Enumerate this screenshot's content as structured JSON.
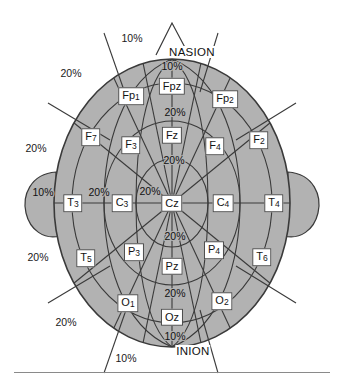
{
  "figure": {
    "scalp_color": "#b2b2b2",
    "outline_color": "#3a3a3a",
    "label_box_color": "#ffffff"
  },
  "anatomy": {
    "nasion": "NASION",
    "inion": "INION"
  },
  "electrodes": [
    {
      "id": "Fpz",
      "label": "Fpz",
      "main": "Fpz",
      "sub": "",
      "x": 172,
      "y": 86
    },
    {
      "id": "Fp1",
      "label": "Fp1",
      "main": "Fp",
      "sub": "1",
      "x": 131,
      "y": 96
    },
    {
      "id": "Fp2",
      "label": "Fp2",
      "main": "Fp",
      "sub": "2",
      "x": 225,
      "y": 99
    },
    {
      "id": "Fz",
      "label": "Fz",
      "main": "Fz",
      "sub": "",
      "x": 172,
      "y": 135
    },
    {
      "id": "F7",
      "label": "F7",
      "main": "F",
      "sub": "7",
      "x": 91,
      "y": 137
    },
    {
      "id": "F3",
      "label": "F3",
      "main": "F",
      "sub": "3",
      "x": 131,
      "y": 145
    },
    {
      "id": "F4",
      "label": "F4",
      "main": "F",
      "sub": "4",
      "x": 215,
      "y": 146
    },
    {
      "id": "F2",
      "label": "F2",
      "main": "F",
      "sub": "2",
      "x": 259,
      "y": 140
    },
    {
      "id": "T3",
      "label": "T3",
      "main": "T",
      "sub": "3",
      "x": 73,
      "y": 203
    },
    {
      "id": "C3",
      "label": "C3",
      "main": "C",
      "sub": "3",
      "x": 122,
      "y": 203
    },
    {
      "id": "Cz",
      "label": "Cz",
      "main": "Cz",
      "sub": "",
      "x": 172,
      "y": 203
    },
    {
      "id": "C4",
      "label": "C4",
      "main": "C",
      "sub": "4",
      "x": 223,
      "y": 203
    },
    {
      "id": "T4",
      "label": "T4",
      "main": "T",
      "sub": "4",
      "x": 274,
      "y": 203
    },
    {
      "id": "P3",
      "label": "P3",
      "main": "P",
      "sub": "3",
      "x": 134,
      "y": 252
    },
    {
      "id": "Pz",
      "label": "Pz",
      "main": "Pz",
      "sub": "",
      "x": 172,
      "y": 266
    },
    {
      "id": "P4",
      "label": "P4",
      "main": "P",
      "sub": "4",
      "x": 214,
      "y": 250
    },
    {
      "id": "T5",
      "label": "T5",
      "main": "T",
      "sub": "5",
      "x": 86,
      "y": 258
    },
    {
      "id": "T6",
      "label": "T6",
      "main": "T",
      "sub": "6",
      "x": 262,
      "y": 257
    },
    {
      "id": "O1",
      "label": "O1",
      "main": "O",
      "sub": "1",
      "x": 128,
      "y": 303
    },
    {
      "id": "Oz",
      "label": "Oz",
      "main": "Oz",
      "sub": "",
      "x": 172,
      "y": 317
    },
    {
      "id": "O2",
      "label": "O2",
      "main": "O",
      "sub": "2",
      "x": 222,
      "y": 301
    }
  ],
  "percent_labels": [
    {
      "id": "pct-sagittal-nasion-fpz",
      "text": "10%",
      "x": 172,
      "y": 66,
      "where": "onhead"
    },
    {
      "id": "pct-sagittal-fpz-fz",
      "text": "20%",
      "x": 175,
      "y": 112,
      "where": "onhead"
    },
    {
      "id": "pct-sagittal-fz-cz",
      "text": "20%",
      "x": 174,
      "y": 160,
      "where": "onhead"
    },
    {
      "id": "pct-sagittal-cz-pz",
      "text": "20%",
      "x": 175,
      "y": 236,
      "where": "onhead"
    },
    {
      "id": "pct-sagittal-pz-oz",
      "text": "20%",
      "x": 175,
      "y": 293,
      "where": "onhead"
    },
    {
      "id": "pct-sagittal-oz-inion",
      "text": "10%",
      "x": 175,
      "y": 336,
      "where": "onhead"
    },
    {
      "id": "pct-coronal-ear-t3",
      "text": "10%",
      "x": 43,
      "y": 192,
      "where": "onhead"
    },
    {
      "id": "pct-coronal-t3-c3",
      "text": "20%",
      "x": 99,
      "y": 192,
      "where": "onhead"
    },
    {
      "id": "pct-coronal-c3-cz",
      "text": "20%",
      "x": 150,
      "y": 191,
      "where": "onhead"
    },
    {
      "id": "pct-diag-upper-left-10",
      "text": "10%",
      "x": 132,
      "y": 38,
      "where": "outside"
    },
    {
      "id": "pct-diag-left-upper-20",
      "text": "20%",
      "x": 71,
      "y": 73,
      "where": "outside"
    },
    {
      "id": "pct-diag-left-mid-20",
      "text": "20%",
      "x": 36,
      "y": 148,
      "where": "outside"
    },
    {
      "id": "pct-diag-left-lower-20",
      "text": "20%",
      "x": 38,
      "y": 257,
      "where": "outside"
    },
    {
      "id": "pct-diag-left-bottom-20",
      "text": "20%",
      "x": 66,
      "y": 322,
      "where": "outside"
    },
    {
      "id": "pct-diag-bottom-left-10",
      "text": "10%",
      "x": 126,
      "y": 358,
      "where": "outside"
    }
  ]
}
